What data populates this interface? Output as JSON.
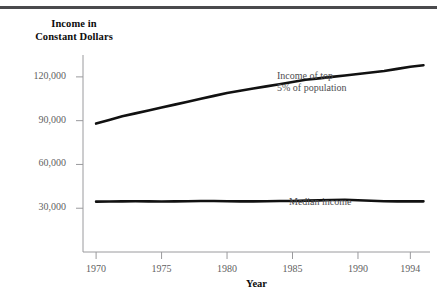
{
  "figure": {
    "y_axis_title_line1": "Income in",
    "y_axis_title_line2": "Constant Dollars",
    "x_axis_title": "Year",
    "annotation_top_line1": "Income of top",
    "annotation_top_line2": "5% of population",
    "annotation_median": "Median income",
    "line_color": "#111111",
    "axis_color": "#9a9a9d",
    "label_color": "#5f5f62",
    "rule_color": "#4a4a4d"
  },
  "chart_data": {
    "type": "line",
    "title": "",
    "xlabel": "Year",
    "ylabel": "Income in Constant Dollars",
    "xlim": [
      1969.0,
      1995.5
    ],
    "ylim": [
      0,
      135000
    ],
    "xticks": [
      1970,
      1975,
      1980,
      1985,
      1990,
      1994
    ],
    "xtick_labels": [
      "1970",
      "1975",
      "1980",
      "1985",
      "1990",
      "1994"
    ],
    "yticks": [
      30000,
      60000,
      90000,
      120000
    ],
    "ytick_labels": [
      "30,000",
      "60,000",
      "90,000",
      "120,000"
    ],
    "grid": false,
    "legend": "annotated-inline",
    "x": [
      1970,
      1971,
      1972,
      1973,
      1974,
      1975,
      1976,
      1977,
      1978,
      1979,
      1980,
      1981,
      1982,
      1983,
      1984,
      1985,
      1986,
      1987,
      1988,
      1989,
      1990,
      1991,
      1992,
      1993,
      1994,
      1995
    ],
    "series": [
      {
        "name": "Income of top 5% of population",
        "values": [
          88000,
          90500,
          93000,
          95000,
          97000,
          99000,
          101000,
          103000,
          105000,
          107000,
          109000,
          110500,
          112000,
          113500,
          115000,
          116500,
          118000,
          119000,
          120000,
          121000,
          122000,
          123000,
          124000,
          125500,
          127000,
          128000
        ]
      },
      {
        "name": "Median income",
        "values": [
          34500,
          34600,
          34700,
          34800,
          34700,
          34600,
          34700,
          34800,
          34900,
          34900,
          34800,
          34700,
          34700,
          34800,
          34900,
          35000,
          35200,
          35400,
          35600,
          35800,
          35500,
          35100,
          34800,
          34700,
          34700,
          34700
        ]
      }
    ]
  }
}
